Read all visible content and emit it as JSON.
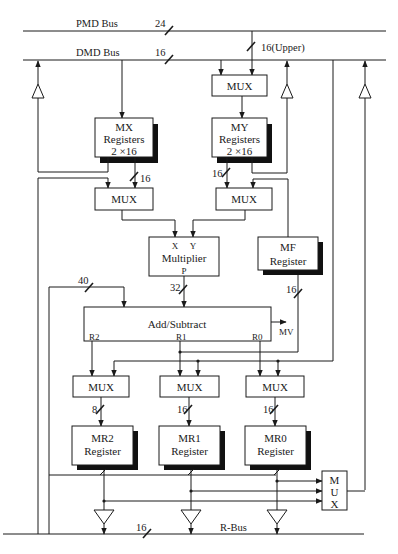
{
  "diagram": {
    "buses": {
      "pmd": {
        "label": "PMD Bus",
        "width": "24"
      },
      "dmd": {
        "label": "DMD Bus",
        "width": "16"
      },
      "pmd_to_mux": {
        "width": "16(Upper)"
      },
      "r_bus": {
        "label": "R-Bus",
        "width": "16"
      }
    },
    "blocks": {
      "top_mux": {
        "label": "MUX"
      },
      "mx_registers": {
        "line1": "MX",
        "line2": "Registers",
        "line3": "2 ×16"
      },
      "my_registers": {
        "line1": "MY",
        "line2": "Registers",
        "line3": "2 ×16"
      },
      "mx_mux": {
        "label": "MUX"
      },
      "my_mux": {
        "label": "MUX"
      },
      "multiplier": {
        "label": "Multiplier",
        "port_x": "X",
        "port_y": "Y",
        "port_p": "P"
      },
      "mf_register": {
        "line1": "MF",
        "line2": "Register"
      },
      "add_subtract": {
        "label": "Add/Subtract",
        "port_r2": "R2",
        "port_r1": "R1",
        "port_r0": "R0",
        "overflow": "MV"
      },
      "mr2_mux": {
        "label": "MUX"
      },
      "mr1_mux": {
        "label": "MUX"
      },
      "mr0_mux": {
        "label": "MUX"
      },
      "mr2_register": {
        "line1": "MR2",
        "line2": "Register"
      },
      "mr1_register": {
        "line1": "MR1",
        "line2": "Register"
      },
      "mr0_register": {
        "line1": "MR0",
        "line2": "Register"
      },
      "out_mux": {
        "l1": "M",
        "l2": "U",
        "l3": "X"
      }
    },
    "bit_widths": {
      "mx_to_mux": "16",
      "my_to_mux": "16",
      "mult_out": "32",
      "feedback": "40",
      "mf_in": "16",
      "mr2_in": "8",
      "mr1_in": "16",
      "mr0_in": "16"
    }
  }
}
